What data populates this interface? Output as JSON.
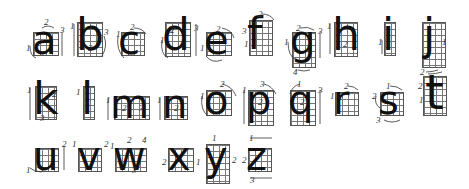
{
  "rows": [
    {
      "letters": [
        {
          "char": "a",
          "strokes": [
            "1",
            "2",
            "3"
          ]
        },
        {
          "char": "b",
          "strokes": [
            "1",
            "2",
            "3"
          ]
        },
        {
          "char": "c",
          "strokes": [
            "1",
            "2"
          ]
        },
        {
          "char": "d",
          "strokes": [
            "1",
            "2",
            "3"
          ]
        },
        {
          "char": "e",
          "strokes": [
            "1",
            "2"
          ]
        },
        {
          "char": "f",
          "strokes": [
            "1",
            "2",
            "3"
          ]
        },
        {
          "char": "g",
          "strokes": [
            "1",
            "2",
            "3",
            "4"
          ]
        },
        {
          "char": "h",
          "strokes": [
            "1",
            "2"
          ]
        },
        {
          "char": "i",
          "strokes": [
            "1"
          ]
        },
        {
          "char": "j",
          "strokes": [
            "1",
            "2"
          ]
        }
      ]
    },
    {
      "letters": [
        {
          "char": "k",
          "strokes": [
            "1",
            "2",
            "3"
          ]
        },
        {
          "char": "l",
          "strokes": [
            "1"
          ]
        },
        {
          "char": "m",
          "strokes": [
            "1",
            "2",
            "3"
          ]
        },
        {
          "char": "n",
          "strokes": [
            "1",
            "2"
          ]
        },
        {
          "char": "o",
          "strokes": [
            "1",
            "2"
          ]
        },
        {
          "char": "p",
          "strokes": [
            "1",
            "2",
            "3"
          ]
        },
        {
          "char": "q",
          "strokes": [
            "1",
            "2",
            "3"
          ]
        },
        {
          "char": "r",
          "strokes": [
            "1",
            "2"
          ]
        },
        {
          "char": "s",
          "strokes": [
            "1",
            "2",
            "3"
          ]
        },
        {
          "char": "t",
          "strokes": [
            "1",
            "2"
          ]
        }
      ]
    },
    {
      "letters": [
        {
          "char": "u",
          "strokes": [
            "1",
            "2"
          ]
        },
        {
          "char": "v",
          "strokes": [
            "1",
            "2"
          ]
        },
        {
          "char": "w",
          "strokes": [
            "1",
            "2",
            "3",
            "4"
          ]
        },
        {
          "char": "x",
          "strokes": [
            "1",
            "2"
          ]
        },
        {
          "char": "y",
          "strokes": [
            "1",
            "2"
          ]
        },
        {
          "char": "z",
          "strokes": [
            "1",
            "2",
            "3"
          ]
        }
      ]
    }
  ]
}
